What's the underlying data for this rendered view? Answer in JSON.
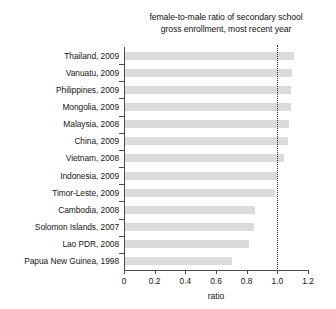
{
  "chart_data": {
    "type": "bar",
    "orientation": "horizontal",
    "title": "female-to-male ratio of secondary school gross enrollment, most recent year",
    "title_lines": [
      "female-to-male ratio of secondary school",
      "gross enrollment, most recent year"
    ],
    "xlabel": "ratio",
    "ylabel": "",
    "xlim": [
      0,
      1.2
    ],
    "xticks": [
      0,
      0.2,
      0.4,
      0.6,
      0.8,
      1.0,
      1.2
    ],
    "xticklabels": [
      "0",
      "0.2",
      "0.4",
      "0.6",
      "0.8",
      "1.0",
      "1.2"
    ],
    "grid": false,
    "legend": null,
    "bar_color": "#dbdbdb",
    "axis_color": "#4a4a4a",
    "reference_line": {
      "value": 1.0,
      "style": "dotted",
      "color": "#2b2b2b"
    },
    "categories": [
      "Thailand, 2009",
      "Vanuatu, 2009",
      "Philippines, 2009",
      "Mongolia, 2009",
      "Malaysia, 2008",
      "China, 2009",
      "Vietnam, 2008",
      "Indonesia, 2009",
      "Timor-Leste, 2009",
      "Cambodia, 2008",
      "Solomon Islands, 2007",
      "Lao PDR, 2008",
      "Papua New Guinea, 1998"
    ],
    "values": [
      1.1,
      1.09,
      1.08,
      1.08,
      1.07,
      1.06,
      1.04,
      0.99,
      0.98,
      0.85,
      0.84,
      0.81,
      0.7
    ]
  }
}
